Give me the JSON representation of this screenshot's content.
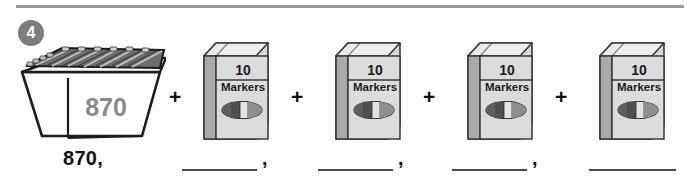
{
  "problem": {
    "number": "4",
    "type": "skip-counting-by-tens"
  },
  "equation": {
    "bin": {
      "label": "870",
      "icon": "bin-of-markers"
    },
    "operator": "+",
    "operators": [
      "+",
      "+",
      "+",
      "+"
    ],
    "boxes": [
      {
        "count": "10",
        "item": "Markers",
        "icon": "marker-icon"
      },
      {
        "count": "10",
        "item": "Markers",
        "icon": "marker-icon"
      },
      {
        "count": "10",
        "item": "Markers",
        "icon": "marker-icon"
      },
      {
        "count": "10",
        "item": "Markers",
        "icon": "marker-icon"
      }
    ]
  },
  "answer_row": {
    "start_value": "870,",
    "blanks": [
      {
        "value": "",
        "separator": ","
      },
      {
        "value": "",
        "separator": ","
      },
      {
        "value": "",
        "separator": ","
      },
      {
        "value": "",
        "separator": ""
      }
    ]
  },
  "colors": {
    "rule": "#9a9a9a",
    "badge_fill": "#7d7d7d",
    "badge_text": "#ffffff",
    "bin_label_text": "#8a8a8a",
    "box_face": "#d9d9d9",
    "box_side": "#a9a9a9",
    "box_top": "#ececec",
    "outline": "#2b2b2b",
    "text": "#111111",
    "blank_line": "#4a4a4a"
  }
}
